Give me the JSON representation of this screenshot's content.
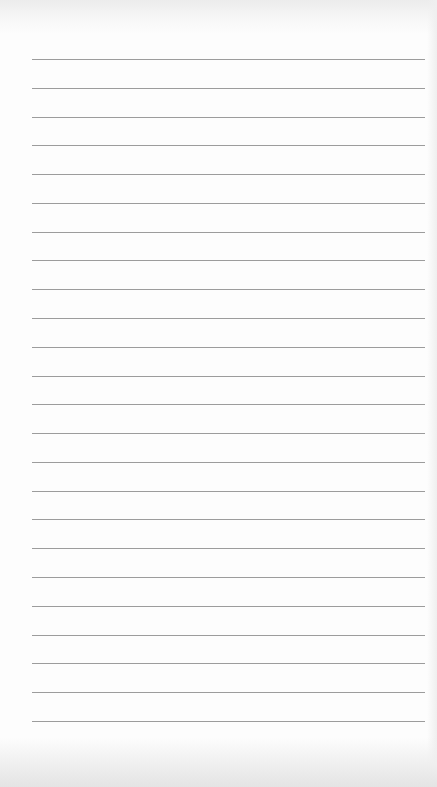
{
  "page": {
    "type": "lined-paper",
    "background_color": "#fdfdfd",
    "line_color": "#9c9c9c"
  },
  "rules": {
    "count": 24,
    "left": 32,
    "right": 425,
    "first_y": 59,
    "spacing": 28.78
  }
}
